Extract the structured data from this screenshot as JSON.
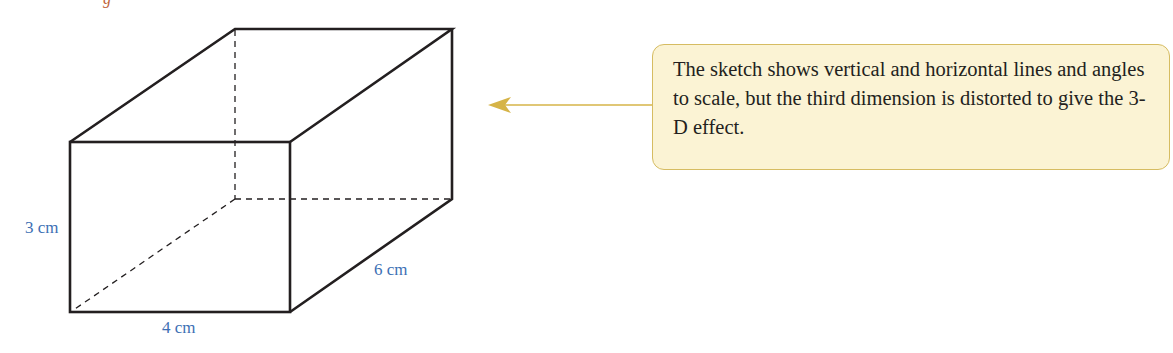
{
  "figure": {
    "type": "cuboid-sketch",
    "header_fragment": "g",
    "dimensions": {
      "height": "3 cm",
      "width": "4 cm",
      "depth": "6 cm"
    },
    "colors": {
      "edge": "#231f20",
      "label": "#3d6fb4",
      "callout_fill": "#fbf3d4",
      "callout_border": "#d6bc62",
      "arrow": "#d6b448"
    }
  },
  "callout": {
    "text": "The sketch shows vertical and horizontal lines and angles to scale, but the third dimension is distorted to give the 3-D effect."
  }
}
